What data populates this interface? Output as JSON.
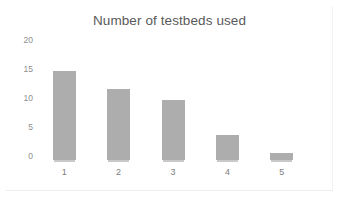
{
  "chart_data": {
    "type": "bar",
    "title": "Number of testbeds used",
    "xlabel": "",
    "ylabel": "",
    "categories": [
      "1",
      "2",
      "3",
      "4",
      "5"
    ],
    "values": [
      15.3,
      12.3,
      10.3,
      4.3,
      1.2
    ],
    "ylim": [
      0,
      20
    ],
    "yticks": [
      0,
      5,
      10,
      15,
      20
    ],
    "ytick_labels": [
      "0",
      "5",
      "10",
      "15",
      "20"
    ],
    "grid": false,
    "legend": false,
    "legend_position": "none",
    "series": [
      {
        "name": "Number of testbeds used",
        "values": [
          15.3,
          12.3,
          10.3,
          4.3,
          1.2
        ]
      }
    ],
    "bar_color": "#adadad",
    "background_color": "#ffffff",
    "title_color": "#5a5a5a",
    "tick_label_color": "#8e8e8e"
  }
}
